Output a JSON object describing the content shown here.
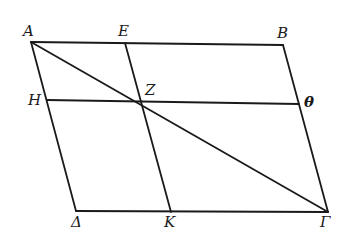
{
  "figure": {
    "stroke_color": "#1a1a1a",
    "points": {
      "A": {
        "label": "A",
        "x": 31,
        "y": 42
      },
      "E": {
        "label": "E",
        "x": 125,
        "y": 43
      },
      "B": {
        "label": "B",
        "x": 283,
        "y": 45
      },
      "H": {
        "label": "H",
        "x": 47,
        "y": 100
      },
      "Z": {
        "label": "Z",
        "x": 141,
        "y": 101
      },
      "Theta": {
        "label": "θ",
        "x": 299,
        "y": 104
      },
      "Delta": {
        "label": "Δ",
        "x": 76,
        "y": 211
      },
      "K": {
        "label": "K",
        "x": 171,
        "y": 212
      },
      "Gamma": {
        "label": "Γ",
        "x": 328,
        "y": 212
      }
    },
    "segments": [
      [
        "A",
        "B"
      ],
      [
        "B",
        "Gamma"
      ],
      [
        "Gamma",
        "Delta"
      ],
      [
        "Delta",
        "A"
      ],
      [
        "A",
        "Gamma"
      ],
      [
        "E",
        "K"
      ],
      [
        "H",
        "Theta"
      ]
    ]
  }
}
